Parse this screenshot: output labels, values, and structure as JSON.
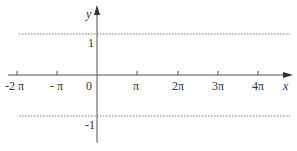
{
  "diagram": {
    "axes": {
      "x_label": "x",
      "y_label": "y",
      "origin_label": "0",
      "color": "#555555"
    },
    "x_ticks": [
      {
        "label": "-2 π",
        "x": 17
      },
      {
        "label": "- π",
        "x": 57
      },
      {
        "label": "π",
        "x": 137
      },
      {
        "label": "2π",
        "x": 178
      },
      {
        "label": "3π",
        "x": 218
      },
      {
        "label": "4π",
        "x": 258
      }
    ],
    "y_ticks": [
      {
        "label": "1",
        "value": 1
      },
      {
        "label": "-1",
        "value": -1
      }
    ],
    "reference_lines": [
      {
        "value": 1,
        "style": "dotted"
      },
      {
        "value": -1,
        "style": "dotted"
      }
    ]
  }
}
